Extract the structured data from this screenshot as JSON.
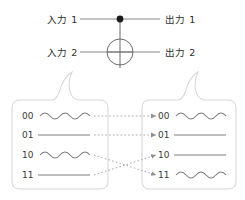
{
  "diagram": {
    "colors": {
      "wire": "#8a8a8a",
      "gate_stroke": "#6b6b6b",
      "control_dot": "#1a1a1a",
      "box_border": "#d8d8d8",
      "box_fill": "#ffffff",
      "arrow": "#a9a9a9",
      "text": "#333333",
      "wave": "#7d7d7d"
    }
  },
  "circuit": {
    "inputs": [
      {
        "label": "入力 1",
        "name": "input-1"
      },
      {
        "label": "入力 2",
        "name": "input-2"
      }
    ],
    "outputs": [
      {
        "label": "出力 1",
        "name": "output-1"
      },
      {
        "label": "出力 2",
        "name": "output-2"
      }
    ],
    "gate": {
      "type": "cnot",
      "control_icon": "filled-dot-icon",
      "target_icon": "circle-plus-icon"
    }
  },
  "input_box": {
    "name": "input-states-box",
    "rows": [
      {
        "label": "00",
        "waveform": "wavy"
      },
      {
        "label": "01",
        "waveform": "straight"
      },
      {
        "label": "10",
        "waveform": "wavy"
      },
      {
        "label": "11",
        "waveform": "straight"
      }
    ]
  },
  "output_box": {
    "name": "output-states-box",
    "rows": [
      {
        "label": "00",
        "waveform": "wavy"
      },
      {
        "label": "01",
        "waveform": "straight"
      },
      {
        "label": "10",
        "waveform": "straight"
      },
      {
        "label": "11",
        "waveform": "wavy"
      }
    ]
  },
  "mapping": {
    "description": "CNOT truth table mapping from input states to output states",
    "edges": [
      {
        "from": "00",
        "to": "00",
        "style": "dotted",
        "crossing": false
      },
      {
        "from": "01",
        "to": "01",
        "style": "dotted",
        "crossing": false
      },
      {
        "from": "10",
        "to": "11",
        "style": "dotted",
        "crossing": true
      },
      {
        "from": "11",
        "to": "10",
        "style": "dotted",
        "crossing": true
      }
    ]
  }
}
